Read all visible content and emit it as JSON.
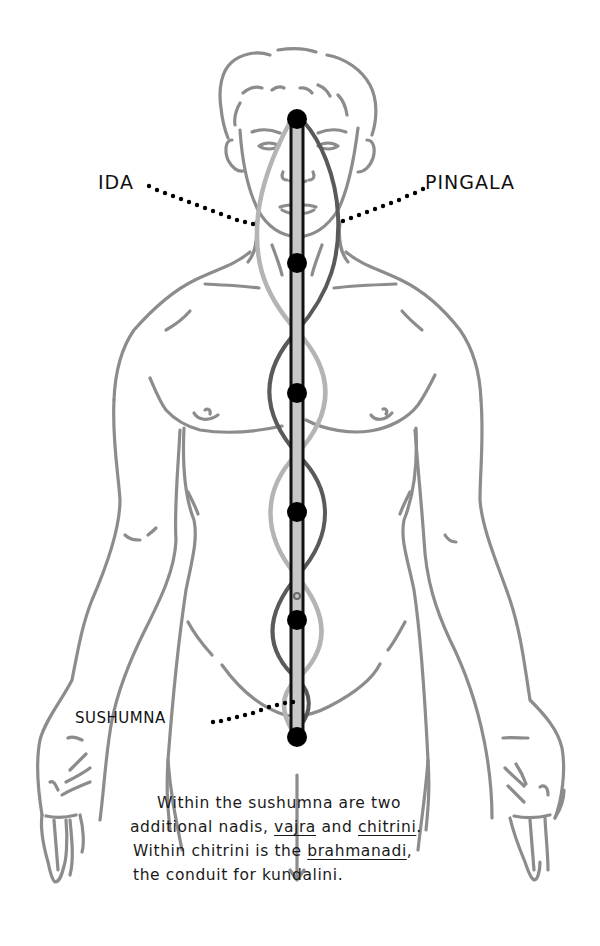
{
  "diagram": {
    "type": "anatomical illustration",
    "colors": {
      "background": "#ffffff",
      "body_outline": "#8c8c8c",
      "ida_channel": "#b4b4b4",
      "pingala_channel": "#5a5a5a",
      "sushumna_fill": "#c8c8c8",
      "sushumna_border": "#111111",
      "chakra_nodes": "#000000",
      "leader_dots": "#000000",
      "text": "#111111"
    },
    "labels": {
      "ida": "IDA",
      "pingala": "PINGALA",
      "sushumna": "SUSHUMNA"
    },
    "chakra_nodes": [
      {
        "name": "node-1",
        "cy": 119
      },
      {
        "name": "node-2",
        "cy": 263
      },
      {
        "name": "node-3",
        "cy": 393
      },
      {
        "name": "node-4",
        "cy": 512
      },
      {
        "name": "node-5",
        "cy": 620
      },
      {
        "name": "node-6",
        "cy": 737
      }
    ]
  },
  "caption": {
    "line1": {
      "text": "Within the sushumna are two"
    },
    "line2": {
      "pre": "additional nadis, ",
      "term1": "vajra",
      "mid": " and ",
      "term2": "chitrini",
      "post": "."
    },
    "line3": {
      "pre": "Within chitrini is the ",
      "term": "brahmanadi",
      "post": ","
    },
    "line4": {
      "text": "the conduit for kundalini."
    }
  }
}
